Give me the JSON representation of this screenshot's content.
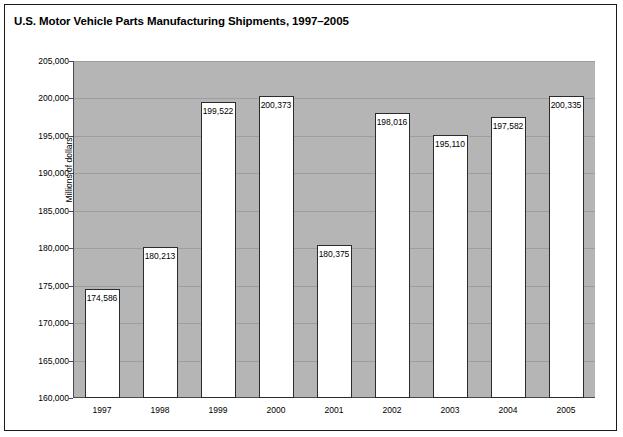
{
  "chart_data": {
    "type": "bar",
    "title": "U.S. Motor Vehicle Parts Manufacturing Shipments, 1997–2005",
    "xlabel": "",
    "ylabel": "Millions of dollars",
    "categories": [
      "1997",
      "1998",
      "1999",
      "2000",
      "2001",
      "2002",
      "2003",
      "2004",
      "2005"
    ],
    "values": [
      174586,
      180213,
      199522,
      200373,
      180375,
      198016,
      195110,
      197582,
      200335
    ],
    "value_labels": [
      "174,586",
      "180,213",
      "199,522",
      "200,373",
      "180,375",
      "198,016",
      "195,110",
      "197,582",
      "200,335"
    ],
    "ylim": [
      160000,
      205000
    ],
    "ytick_values": [
      160000,
      165000,
      170000,
      175000,
      180000,
      185000,
      190000,
      195000,
      200000,
      205000
    ],
    "ytick_labels": [
      "160,000",
      "165,000",
      "170,000",
      "175,000",
      "180,000",
      "185,000",
      "190,000",
      "195,000",
      "200,000",
      "205,000"
    ],
    "grid": true,
    "legend": null,
    "colors": {
      "plot_background": "#b5b5b5",
      "bar_fill": "#ffffff",
      "bar_border": "#2b2b2b",
      "gridline": "#9e9e9e",
      "axis": "#4a4a4a",
      "text": "#000000",
      "frame_border": "#1a1a1a"
    }
  }
}
